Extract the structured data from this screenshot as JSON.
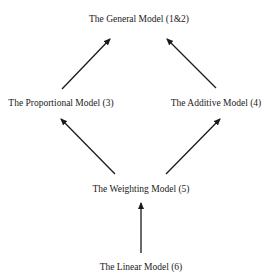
{
  "diagram": {
    "type": "hierarchy",
    "colors": {
      "background": "#ffffff",
      "ink": "#1a1a1a"
    },
    "nodes": [
      {
        "id": "general",
        "label": "The General Model (1&2)"
      },
      {
        "id": "proportional",
        "label": "The Proportional Model (3)"
      },
      {
        "id": "additive",
        "label": "The Additive Model (4)"
      },
      {
        "id": "weighting",
        "label": "The Weighting Model (5)"
      },
      {
        "id": "linear",
        "label": "The Linear Model (6)"
      }
    ],
    "edges": [
      {
        "from": "proportional",
        "to": "general"
      },
      {
        "from": "additive",
        "to": "general"
      },
      {
        "from": "weighting",
        "to": "proportional"
      },
      {
        "from": "weighting",
        "to": "additive"
      },
      {
        "from": "linear",
        "to": "weighting"
      }
    ]
  }
}
